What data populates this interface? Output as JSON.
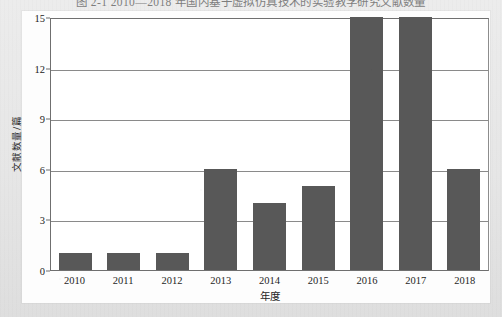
{
  "figure": {
    "caption": "图 2-1  2010—2018 年国内基于虚拟仿真技术的实验教学研究文献数量",
    "caption_visible_note": "clipped at top edge"
  },
  "chart_data": {
    "type": "bar",
    "title": "",
    "categories": [
      "2010",
      "2011",
      "2012",
      "2013",
      "2014",
      "2015",
      "2016",
      "2017",
      "2018"
    ],
    "values": [
      1,
      1,
      1,
      6,
      4,
      5,
      15,
      15,
      6
    ],
    "xlabel": "年度",
    "ylabel": "文献数量/篇",
    "ylim": [
      0,
      15
    ],
    "yticks": [
      0,
      3,
      6,
      9,
      12,
      15
    ],
    "grid": true,
    "legend": "none",
    "bar_color": "#585858",
    "axis_color": "#6f6f6f",
    "plot_background": "#ffffff"
  },
  "page": {
    "background_color": "#e9e9e9",
    "card_color": "#fdfdfd"
  }
}
